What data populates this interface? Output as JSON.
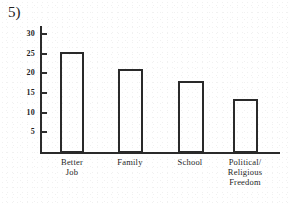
{
  "figure": {
    "number_label": "5)"
  },
  "chart_data": {
    "type": "bar",
    "title": "",
    "xlabel": "",
    "ylabel": "",
    "categories": [
      "Better\nJob",
      "Family",
      "School",
      "Political/\nReligious\nFreedom"
    ],
    "values": [
      25.5,
      21,
      18,
      13.5
    ],
    "ylim": [
      0,
      32
    ],
    "yticks": [
      5,
      10,
      15,
      20,
      25,
      30
    ],
    "ytick_labels": [
      "5",
      "10",
      "15",
      "20",
      "25",
      "30"
    ],
    "grid": false,
    "legend": null,
    "style": {
      "bar_fill": "#ffffff",
      "bar_border": "#2a2a2a",
      "axis_color": "#2b2b2b",
      "text_color": "#1f1f1f",
      "background": "#ffffff"
    }
  }
}
